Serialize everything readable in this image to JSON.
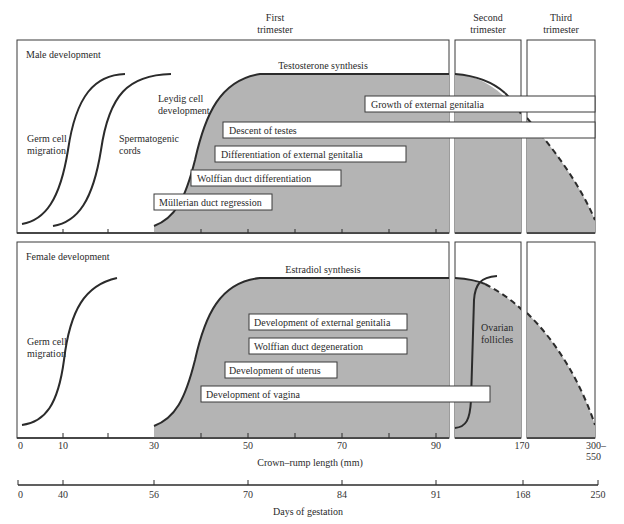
{
  "trimesters": {
    "first": [
      "First",
      "trimester"
    ],
    "second": [
      "Second",
      "trimester"
    ],
    "third": [
      "Third",
      "trimester"
    ]
  },
  "male": {
    "title": "Male development",
    "hormone": "Testosterone synthesis",
    "curves": {
      "germ_cell": [
        "Germ cell",
        "migration"
      ],
      "spermatogenic": [
        "Spermatogenic",
        "cords"
      ],
      "leydig": [
        "Leydig cell",
        "development"
      ]
    },
    "bars": [
      {
        "label": "Growth of external genitalia",
        "x": 365,
        "y": 96,
        "w": 230
      },
      {
        "label": "Descent of testes",
        "x": 223,
        "y": 122,
        "w": 372
      },
      {
        "label": "Differentiation of external genitalia",
        "x": 215,
        "y": 146,
        "w": 191
      },
      {
        "label": "Wolffian duct differentiation",
        "x": 191,
        "y": 170,
        "w": 150
      },
      {
        "label": "Müllerian duct regression",
        "x": 154,
        "y": 194,
        "w": 118
      }
    ]
  },
  "female": {
    "title": "Female development",
    "hormone": "Estradiol synthesis",
    "curves": {
      "germ_cell": [
        "Germ cell",
        "migration"
      ],
      "ovarian": [
        "Ovarian",
        "follicles"
      ]
    },
    "bars": [
      {
        "label": "Development of external genitalia",
        "x": 249,
        "y": 314,
        "w": 158
      },
      {
        "label": "Wolffian duct degeneration",
        "x": 249,
        "y": 338,
        "w": 158
      },
      {
        "label": "Development of uterus",
        "x": 225,
        "y": 362,
        "w": 112
      },
      {
        "label": "Development of vagina",
        "x": 201,
        "y": 386,
        "w": 289
      }
    ]
  },
  "axis_crl": {
    "title": "Crown–rump length (mm)",
    "ticks": [
      {
        "x": 18,
        "label": "0"
      },
      {
        "x": 63,
        "label": "10"
      },
      {
        "x": 154,
        "label": "30"
      },
      {
        "x": 248,
        "label": "50"
      },
      {
        "x": 342,
        "label": "70"
      },
      {
        "x": 436,
        "label": "90"
      },
      {
        "x": 522,
        "label": "170"
      },
      {
        "x": 595,
        "label": "300–"
      }
    ],
    "extra_label": "550"
  },
  "axis_days": {
    "title": "Days of gestation",
    "ticks": [
      {
        "x": 18,
        "label": "0"
      },
      {
        "x": 63,
        "label": "40"
      },
      {
        "x": 154,
        "label": "56"
      },
      {
        "x": 248,
        "label": "70"
      },
      {
        "x": 342,
        "label": "84"
      },
      {
        "x": 436,
        "label": "91"
      },
      {
        "x": 522,
        "label": "168"
      },
      {
        "x": 595,
        "label": "250"
      }
    ]
  },
  "colors": {
    "shade": "#b4b4b4",
    "line": "#2b2b2b",
    "panel_bg": "#ffffff"
  }
}
